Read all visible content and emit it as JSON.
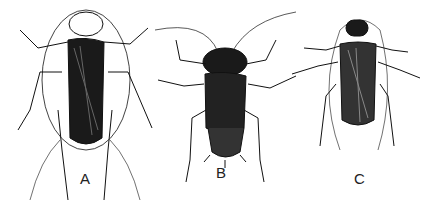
{
  "figure": {
    "specimens": [
      {
        "label": "A",
        "x": 86,
        "y": 182
      },
      {
        "label": "B",
        "x": 220,
        "y": 176
      },
      {
        "label": "C",
        "x": 360,
        "y": 182
      }
    ]
  }
}
